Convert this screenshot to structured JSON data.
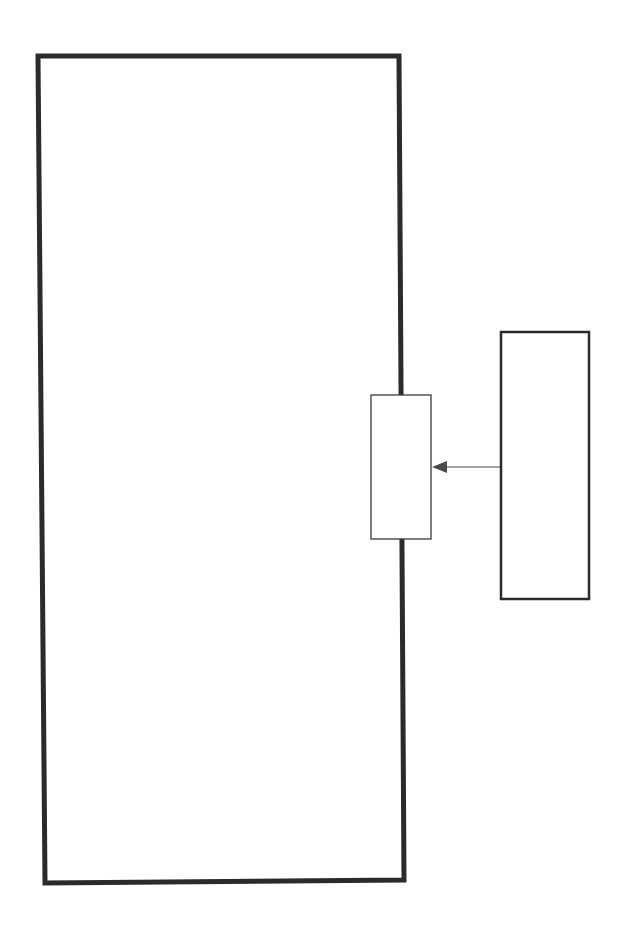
{
  "canvas": {
    "width": 633,
    "height": 935,
    "background": "#ffffff"
  },
  "colors": {
    "thick_stroke": "#2b2b2b",
    "thin_stroke": "#3a3a3a",
    "arrow": "#4a4a4a",
    "fill": "#ffffff"
  },
  "shapes": {
    "large_rect": {
      "points": "38,56 399,56 404,880 45,883",
      "stroke_width": 5
    },
    "small_box": {
      "x": 371,
      "y": 395,
      "width": 60,
      "height": 144,
      "stroke_width": 1.3
    },
    "right_rect": {
      "x": 501,
      "y": 332,
      "width": 88,
      "height": 267,
      "stroke_width": 2.5
    },
    "arrow": {
      "x1": 500,
      "y1": 467,
      "x2": 446,
      "y2": 467,
      "head_tip_x": 432,
      "head_tip_y": 467,
      "stroke_width": 1.2
    }
  },
  "labels": []
}
